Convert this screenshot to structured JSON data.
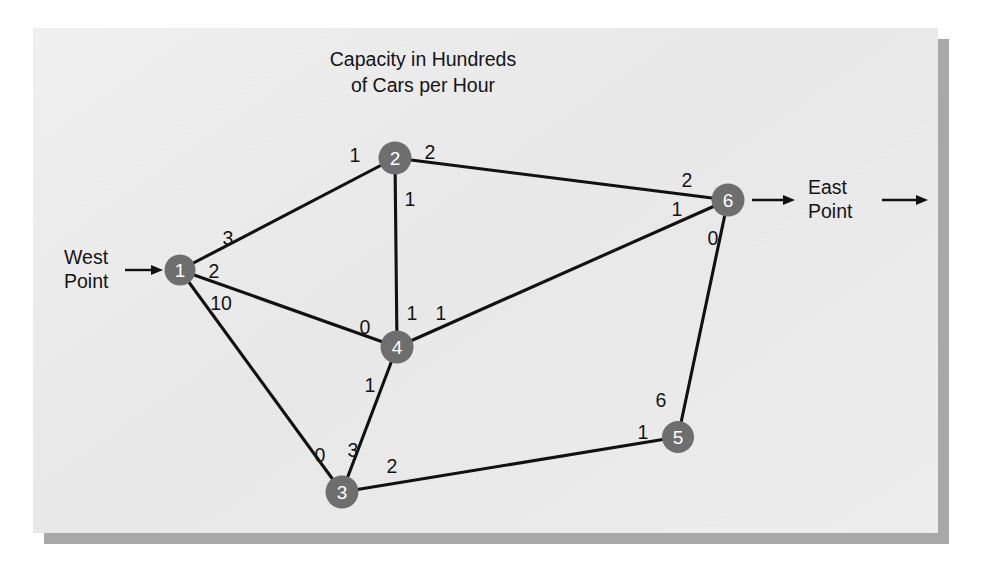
{
  "title": {
    "line1": "Capacity in Hundreds",
    "line2": "of Cars per Hour"
  },
  "terminals": {
    "west": {
      "line1": "West",
      "line2": "Point"
    },
    "east": {
      "line1": "East",
      "line2": "Point"
    }
  },
  "colors": {
    "node_fill": "#6e6e6e",
    "node_text": "#ffffff",
    "edge": "#111111",
    "panel_bg": "#ececec",
    "shadow": "#a8a8a8",
    "label_text": "#141414"
  },
  "chart_data": {
    "type": "diagram",
    "subtype": "network-flow-graph",
    "title": "Capacity in Hundreds of Cars per Hour",
    "units": "hundreds of cars per hour",
    "source_label": "West Point",
    "sink_label": "East Point",
    "nodes": [
      {
        "id": "1",
        "label": "1",
        "x": 180,
        "y": 270,
        "r": 15.5
      },
      {
        "id": "2",
        "label": "2",
        "x": 395,
        "y": 158,
        "r": 16.5
      },
      {
        "id": "3",
        "label": "3",
        "x": 342,
        "y": 492,
        "r": 16.5
      },
      {
        "id": "4",
        "label": "4",
        "x": 397,
        "y": 347,
        "r": 16.5
      },
      {
        "id": "5",
        "label": "5",
        "x": 678,
        "y": 437,
        "r": 16.0
      },
      {
        "id": "6",
        "label": "6",
        "x": 728,
        "y": 200,
        "r": 16.5
      }
    ],
    "edges": [
      {
        "from": "1",
        "to": "2",
        "cap_from": "3",
        "cap_to": "1",
        "label_from_x": 228,
        "label_from_y": 238,
        "label_to_x": 355,
        "label_to_y": 155
      },
      {
        "from": "1",
        "to": "4",
        "cap_from": "2",
        "cap_to": "0",
        "label_from_x": 214,
        "label_from_y": 271,
        "label_to_x": 365,
        "label_to_y": 327
      },
      {
        "from": "1",
        "to": "3",
        "cap_from": "10",
        "cap_to": "0",
        "label_from_x": 221,
        "label_from_y": 303,
        "label_to_x": 320,
        "label_to_y": 455
      },
      {
        "from": "2",
        "to": "4",
        "cap_from": "1",
        "cap_to": "1",
        "label_from_x": 410,
        "label_from_y": 199,
        "label_to_x": 412,
        "label_to_y": 313
      },
      {
        "from": "2",
        "to": "6",
        "cap_from": "2",
        "cap_to": "2",
        "label_from_x": 430,
        "label_from_y": 152,
        "label_to_x": 687,
        "label_to_y": 180
      },
      {
        "from": "4",
        "to": "6",
        "cap_from": "1",
        "cap_to": "1",
        "label_from_x": 441,
        "label_from_y": 313,
        "label_to_x": 677,
        "label_to_y": 209
      },
      {
        "from": "4",
        "to": "3",
        "cap_from": "1",
        "cap_to": "3",
        "label_from_x": 370,
        "label_from_y": 385,
        "label_to_x": 353,
        "label_to_y": 450
      },
      {
        "from": "3",
        "to": "5",
        "cap_from": "2",
        "cap_to": "1",
        "label_from_x": 392,
        "label_from_y": 466,
        "label_to_x": 643,
        "label_to_y": 432
      },
      {
        "from": "5",
        "to": "6",
        "cap_from": "6",
        "cap_to": "0",
        "label_from_x": 661,
        "label_from_y": 400,
        "label_to_x": 713,
        "label_to_y": 238
      }
    ]
  }
}
